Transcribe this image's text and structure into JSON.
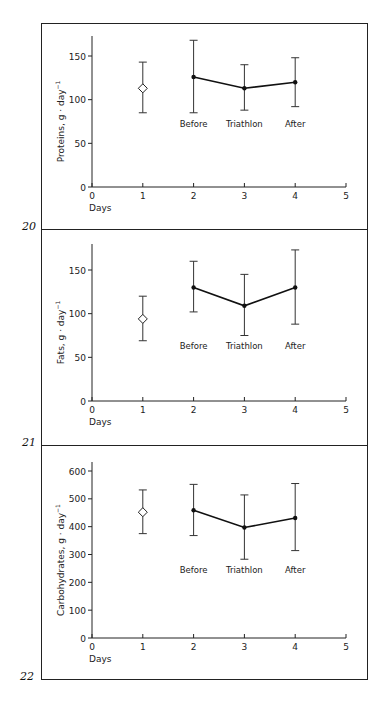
{
  "figure": {
    "frame_color": "#222222",
    "line_color": "#111111",
    "errorbar_color": "#333333"
  },
  "chart_data": [
    {
      "type": "line",
      "figure_number": "20",
      "title": "",
      "xlabel": "Days",
      "ylabel": "Proteins, g · day⁻¹",
      "ylabel_main": "Proteins,  g · day",
      "ylabel_sup": "−1",
      "xlim": [
        0,
        5
      ],
      "ylim": [
        0,
        175
      ],
      "xticks": [
        0,
        1,
        2,
        3,
        4,
        5
      ],
      "yticks": [
        0,
        50,
        100,
        150
      ],
      "grid": false,
      "legend": null,
      "reference_point": {
        "x": 1,
        "y": 113,
        "err_low": 85,
        "err_high": 143,
        "marker": "open-diamond"
      },
      "series": [
        {
          "name": "Triathlon period",
          "marker": "filled-circle",
          "x": [
            2,
            3,
            4
          ],
          "y": [
            126,
            113,
            120
          ],
          "err_low": [
            85,
            88,
            92
          ],
          "err_high": [
            168,
            140,
            148
          ],
          "point_labels": [
            "Before",
            "Triathlon",
            "After"
          ]
        }
      ]
    },
    {
      "type": "line",
      "figure_number": "21",
      "title": "",
      "xlabel": "Days",
      "ylabel": "Fats, g · day⁻¹",
      "ylabel_main": "Fats,  g · day",
      "ylabel_sup": "−1",
      "xlim": [
        0,
        5
      ],
      "ylim": [
        0,
        180
      ],
      "xticks": [
        0,
        1,
        2,
        3,
        4,
        5
      ],
      "yticks": [
        0,
        50,
        100,
        150
      ],
      "grid": false,
      "legend": null,
      "reference_point": {
        "x": 1,
        "y": 94,
        "err_low": 69,
        "err_high": 120,
        "marker": "open-diamond"
      },
      "series": [
        {
          "name": "Triathlon period",
          "marker": "filled-circle",
          "x": [
            2,
            3,
            4
          ],
          "y": [
            130,
            109,
            130
          ],
          "err_low": [
            102,
            75,
            88
          ],
          "err_high": [
            160,
            145,
            173
          ],
          "point_labels": [
            "Before",
            "Triathlon",
            "After"
          ]
        }
      ]
    },
    {
      "type": "line",
      "figure_number": "22",
      "title": "",
      "xlabel": "Days",
      "ylabel": "Carbohydrates, g · day⁻¹",
      "ylabel_main": "Carbohydrates,  g · day",
      "ylabel_sup": "−1",
      "xlim": [
        0,
        5
      ],
      "ylim": [
        0,
        600
      ],
      "xticks": [
        0,
        1,
        2,
        3,
        4,
        5
      ],
      "yticks": [
        0,
        100,
        200,
        300,
        400,
        500,
        600
      ],
      "grid": false,
      "legend": null,
      "reference_point": {
        "x": 1,
        "y": 452,
        "err_low": 375,
        "err_high": 532,
        "marker": "open-diamond"
      },
      "series": [
        {
          "name": "Triathlon period",
          "marker": "filled-circle",
          "x": [
            2,
            3,
            4
          ],
          "y": [
            459,
            397,
            431
          ],
          "err_low": [
            368,
            283,
            314
          ],
          "err_high": [
            552,
            514,
            555
          ],
          "point_labels": [
            "Before",
            "Triathlon",
            "After"
          ]
        }
      ]
    }
  ]
}
